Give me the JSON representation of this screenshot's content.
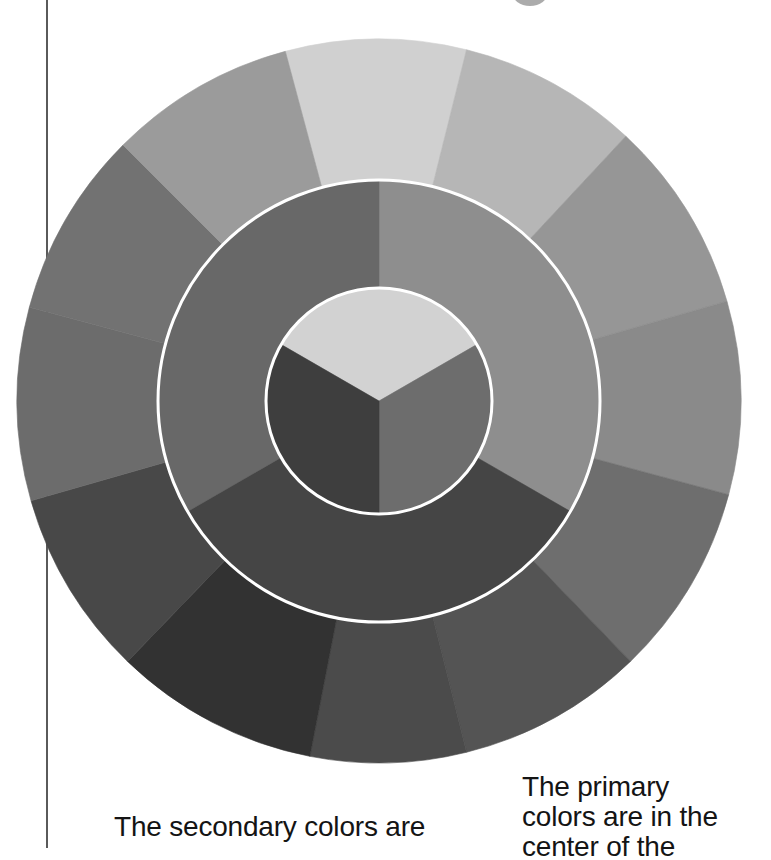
{
  "diagram": {
    "center": [
      379,
      401
    ],
    "outer_ring": {
      "radius": 362,
      "segments": [
        {
          "start": -15,
          "end": 14,
          "fill": "#d0d0d0"
        },
        {
          "start": 14,
          "end": 43,
          "fill": "#b6b6b6"
        },
        {
          "start": 43,
          "end": 74,
          "fill": "#969696"
        },
        {
          "start": 74,
          "end": 105,
          "fill": "#8a8a8a"
        },
        {
          "start": 105,
          "end": 136,
          "fill": "#6e6e6e"
        },
        {
          "start": 136,
          "end": 166,
          "fill": "#545454"
        },
        {
          "start": 166,
          "end": 191,
          "fill": "#4b4b4b"
        },
        {
          "start": 191,
          "end": 224,
          "fill": "#323232"
        },
        {
          "start": 224,
          "end": 254,
          "fill": "#484848"
        },
        {
          "start": 254,
          "end": 285,
          "fill": "#6c6c6c"
        },
        {
          "start": 285,
          "end": 315,
          "fill": "#727272"
        },
        {
          "start": 315,
          "end": 345,
          "fill": "#9b9b9b"
        }
      ]
    },
    "middle_ring": {
      "radius": 221,
      "border": "#ffffff",
      "segments": [
        {
          "start": 0,
          "end": 120,
          "fill": "#8e8e8e"
        },
        {
          "start": 120,
          "end": 240,
          "fill": "#454545"
        },
        {
          "start": 240,
          "end": 360,
          "fill": "#686868"
        }
      ]
    },
    "inner_circle": {
      "radius": 113,
      "border": "#ffffff",
      "segments": [
        {
          "start": -60,
          "end": 60,
          "fill": "#d2d2d2"
        },
        {
          "start": 60,
          "end": 180,
          "fill": "#6d6d6d"
        },
        {
          "start": 180,
          "end": 300,
          "fill": "#3e3e3e"
        }
      ]
    }
  },
  "captions": {
    "secondary": [
      "The secondary colors are"
    ],
    "primary": [
      "The primary",
      "colors are in the",
      "center of the"
    ]
  }
}
